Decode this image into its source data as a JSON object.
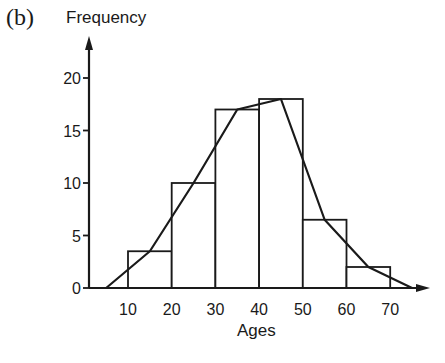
{
  "panel_label": "(b)",
  "colors": {
    "ink": "#1a1a1a",
    "background": "#ffffff"
  },
  "chart_data": {
    "type": "bar",
    "subtype": "histogram-with-frequency-polygon",
    "title": "",
    "xlabel": "Ages",
    "ylabel": "Frequency",
    "x_ticks": [
      10,
      20,
      30,
      40,
      50,
      60,
      70
    ],
    "y_ticks": [
      0,
      5,
      10,
      15,
      20
    ],
    "xlim": [
      0,
      78
    ],
    "ylim": [
      0,
      23
    ],
    "grid": false,
    "legend": null,
    "bins": [
      {
        "start": 10,
        "end": 20,
        "frequency": 3.5
      },
      {
        "start": 20,
        "end": 30,
        "frequency": 10
      },
      {
        "start": 30,
        "end": 40,
        "frequency": 17
      },
      {
        "start": 40,
        "end": 50,
        "frequency": 18
      },
      {
        "start": 50,
        "end": 60,
        "frequency": 6.5
      },
      {
        "start": 60,
        "end": 70,
        "frequency": 2
      }
    ],
    "categories": [
      "10-20",
      "20-30",
      "30-40",
      "40-50",
      "50-60",
      "60-70"
    ],
    "values": [
      3.5,
      10,
      17,
      18,
      6.5,
      2
    ],
    "frequency_polygon": {
      "x": [
        5,
        15,
        25,
        35,
        45,
        55,
        65,
        75
      ],
      "y": [
        0,
        3.5,
        10,
        17,
        18,
        6.5,
        2,
        0
      ]
    }
  }
}
